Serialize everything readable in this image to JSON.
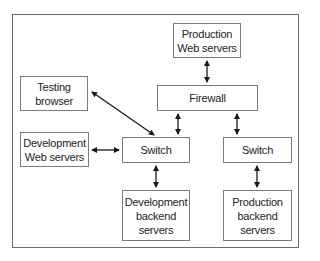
{
  "diagram": {
    "type": "network-topology",
    "colors": {
      "border": "#7a7a7a",
      "frame": "#6b6b6b",
      "arrow": "#1a1a1a",
      "text": "#222222"
    },
    "nodes": [
      {
        "id": "prod_web",
        "lines": [
          "Production",
          "Web servers"
        ]
      },
      {
        "id": "firewall",
        "lines": [
          "Firewall"
        ]
      },
      {
        "id": "testing_browser",
        "lines": [
          "Testing",
          "browser"
        ]
      },
      {
        "id": "dev_web",
        "lines": [
          "Development",
          "Web servers"
        ]
      },
      {
        "id": "switch_dev",
        "lines": [
          "Switch"
        ]
      },
      {
        "id": "switch_prod",
        "lines": [
          "Switch"
        ]
      },
      {
        "id": "dev_backend",
        "lines": [
          "Development",
          "backend",
          "servers"
        ]
      },
      {
        "id": "prod_backend",
        "lines": [
          "Production",
          "backend",
          "servers"
        ]
      }
    ],
    "edges": [
      {
        "from": "prod_web",
        "to": "firewall",
        "direction": "both"
      },
      {
        "from": "firewall",
        "to": "switch_dev",
        "direction": "both"
      },
      {
        "from": "firewall",
        "to": "switch_prod",
        "direction": "both"
      },
      {
        "from": "switch_dev",
        "to": "testing_browser",
        "direction": "both"
      },
      {
        "from": "dev_web",
        "to": "switch_dev",
        "direction": "both"
      },
      {
        "from": "switch_dev",
        "to": "dev_backend",
        "direction": "both"
      },
      {
        "from": "switch_prod",
        "to": "prod_backend",
        "direction": "both"
      }
    ]
  }
}
